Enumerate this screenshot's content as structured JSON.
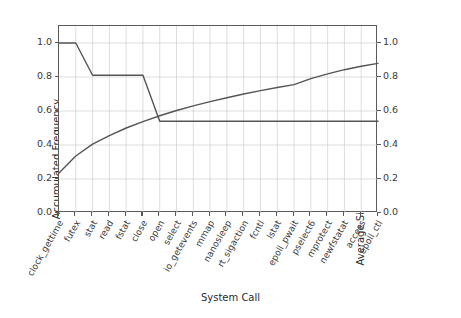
{
  "chart_data": {
    "type": "line",
    "title": "",
    "xlabel": "System Call",
    "ylabel": "Accumulated Frequency",
    "ylabel_right": "Average Size of Characteristic Fingerprints",
    "grid": true,
    "legend": "none",
    "categories": [
      "clock_gettime",
      "futex",
      "stat",
      "read",
      "fstat",
      "close",
      "open",
      "select",
      "io_getevents",
      "mmap",
      "nanosleep",
      "rt_sigaction",
      "fcntl",
      "lstat",
      "epoll_pwait",
      "pselect6",
      "mprotect",
      "newfstatat",
      "access",
      "epoll_ctl"
    ],
    "xlim": [
      0,
      19
    ],
    "ylim": [
      0.0,
      1.1
    ],
    "ylim_right": [
      0.0,
      1.1
    ],
    "yticks": [
      "0.0",
      "0.2",
      "0.4",
      "0.6",
      "0.8",
      "1.0"
    ],
    "ytick_values": [
      0.0,
      0.2,
      0.4,
      0.6,
      0.8,
      1.0
    ],
    "yticks_right": [
      "0.0",
      "0.2",
      "0.4",
      "0.6",
      "0.8",
      "1.0"
    ],
    "ytick_values_right": [
      0.0,
      0.2,
      0.4,
      0.6,
      0.8,
      1.0
    ],
    "series": [
      {
        "name": "Accumulated Frequency",
        "axis": "left",
        "color": "#555555",
        "values": [
          1.0,
          1.0,
          0.81,
          0.81,
          0.81,
          0.81,
          0.54,
          0.54,
          0.54,
          0.54,
          0.54,
          0.54,
          0.54,
          0.54,
          0.54,
          0.54,
          0.54,
          0.54,
          0.54,
          0.54
        ]
      },
      {
        "name": "Average Size of Characteristic Fingerprints",
        "axis": "right",
        "color": "#555555",
        "values": [
          0.235,
          0.335,
          0.405,
          0.455,
          0.5,
          0.538,
          0.572,
          0.603,
          0.63,
          0.655,
          0.678,
          0.7,
          0.72,
          0.738,
          0.755,
          0.79,
          0.818,
          0.843,
          0.863,
          0.88
        ]
      }
    ]
  },
  "colors": {
    "line": "#555555",
    "grid": "#cfcfcf",
    "frame": "#5a5a5a",
    "text": "#2b2b2b",
    "background": "#ffffff"
  }
}
